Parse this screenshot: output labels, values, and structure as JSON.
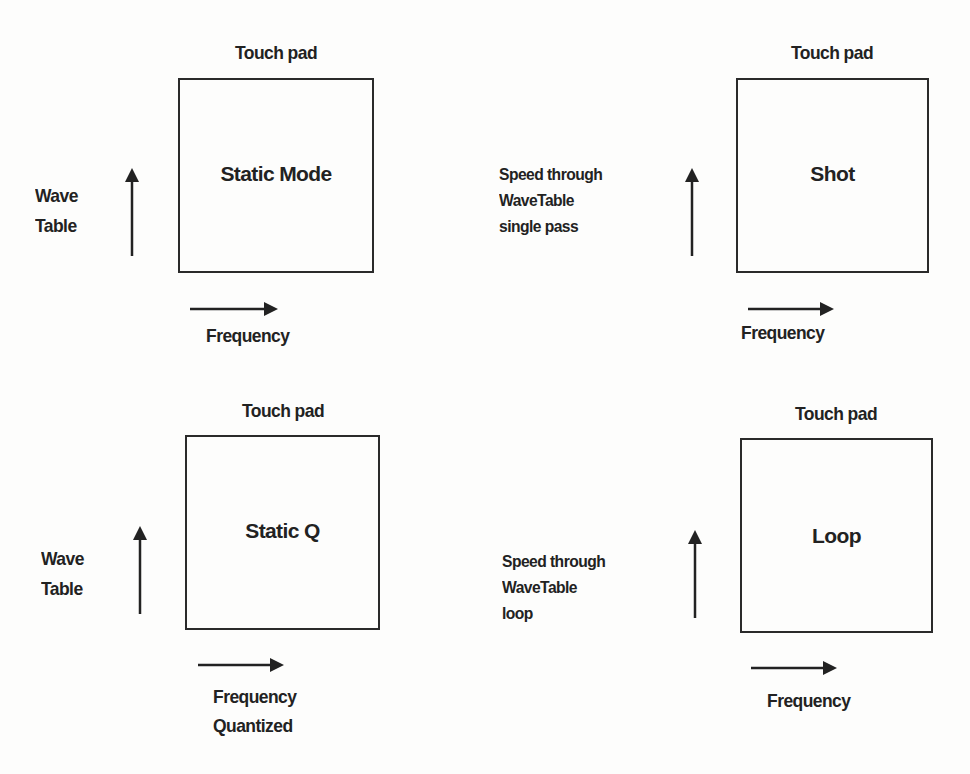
{
  "diagram": {
    "panels": [
      {
        "id": "static-mode",
        "title": "Touch pad",
        "mode": "Static Mode",
        "y_axis_label": [
          "Wave",
          "Table"
        ],
        "x_axis_label": [
          "Frequency"
        ]
      },
      {
        "id": "shot",
        "title": "Touch pad",
        "mode": "Shot",
        "y_axis_label": [
          "Speed through",
          "WaveTable",
          "single pass"
        ],
        "x_axis_label": [
          "Frequency"
        ]
      },
      {
        "id": "static-q",
        "title": "Touch pad",
        "mode": "Static Q",
        "y_axis_label": [
          "Wave",
          "Table"
        ],
        "x_axis_label": [
          "Frequency",
          "Quantized"
        ]
      },
      {
        "id": "loop",
        "title": "Touch pad",
        "mode": "Loop",
        "y_axis_label": [
          "Speed through",
          "WaveTable",
          "loop"
        ],
        "x_axis_label": [
          "Frequency"
        ]
      }
    ],
    "colors": {
      "ink": "#222222",
      "background": "#fdfdfc"
    }
  }
}
